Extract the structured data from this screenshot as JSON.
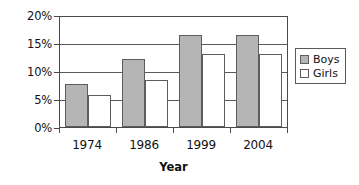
{
  "chart_data": {
    "type": "bar",
    "title": "",
    "xlabel": "Year",
    "ylabel": "",
    "categories": [
      "1974",
      "1986",
      "1999",
      "2004"
    ],
    "series": [
      {
        "name": "Boys",
        "values": [
          7.8,
          12.3,
          16.8,
          16.8
        ],
        "color": "#b5b5b5"
      },
      {
        "name": "Girls",
        "values": [
          5.9,
          8.6,
          13.2,
          13.2
        ],
        "color": "#ffffff"
      }
    ],
    "ylim": [
      0,
      20
    ],
    "ytick_values": [
      0,
      5,
      10,
      15,
      20
    ],
    "ytick_labels": [
      "0%",
      "5%",
      "10%",
      "15%",
      "20%"
    ],
    "grid": true,
    "grid_axis": "y",
    "legend_position": "right",
    "legend_entries": [
      "Boys",
      "Girls"
    ],
    "units": "percent"
  },
  "axis": {
    "x_title": "Year"
  },
  "legend": {
    "items": [
      {
        "label": "Boys",
        "swatch": "gray-filled-square-icon"
      },
      {
        "label": "Girls",
        "swatch": "white-outline-square-icon"
      }
    ]
  }
}
